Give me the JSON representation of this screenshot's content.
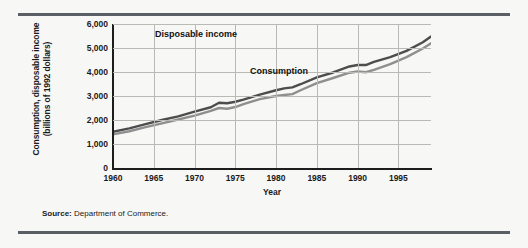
{
  "figure": {
    "source_prefix": "Source:",
    "source_text": " Department of Commerce."
  },
  "axes": {
    "ylabel_line1": "Consumption, disposable income",
    "ylabel_line2": "(billions of 1992 dollars)",
    "xlabel": "Year",
    "yticks": [
      "0",
      "1,000",
      "2,000",
      "3,000",
      "4,000",
      "5,000",
      "6,000"
    ],
    "xticks": [
      "1960",
      "1965",
      "1970",
      "1975",
      "1980",
      "1985",
      "1990",
      "1995"
    ]
  },
  "annotations": {
    "disposable_income": "Disposable income",
    "consumption": "Consumption"
  },
  "colors": {
    "disposable_income": "#4d4d4d",
    "consumption": "#8f8f8f",
    "grid": "#b9b9b5",
    "axis": "#1d1d1d",
    "rule": "#5a5f66"
  },
  "chart_data": {
    "type": "line",
    "title": "",
    "xlabel": "Year",
    "ylabel": "Consumption, disposable income (billions of 1992 dollars)",
    "xlim": [
      1960,
      1999
    ],
    "ylim": [
      0,
      6000
    ],
    "ytick_values": [
      0,
      1000,
      2000,
      3000,
      4000,
      5000,
      6000
    ],
    "xtick_values": [
      1960,
      1965,
      1970,
      1975,
      1980,
      1985,
      1990,
      1995
    ],
    "grid": true,
    "legend": "inline-annotations",
    "x": [
      1960,
      1962,
      1964,
      1966,
      1968,
      1970,
      1972,
      1973,
      1974,
      1975,
      1976,
      1978,
      1980,
      1981,
      1982,
      1983,
      1985,
      1987,
      1989,
      1990,
      1991,
      1992,
      1994,
      1996,
      1998,
      1999
    ],
    "series": [
      {
        "name": "Disposable income",
        "color": "#4d4d4d",
        "values": [
          1510,
          1650,
          1830,
          2000,
          2150,
          2350,
          2530,
          2720,
          2700,
          2760,
          2850,
          3060,
          3240,
          3320,
          3360,
          3490,
          3780,
          3980,
          4230,
          4290,
          4290,
          4420,
          4620,
          4880,
          5240,
          5480
        ]
      },
      {
        "name": "Consumption",
        "color": "#8f8f8f",
        "values": [
          1400,
          1530,
          1700,
          1860,
          2020,
          2180,
          2380,
          2500,
          2470,
          2540,
          2660,
          2870,
          3000,
          3040,
          3080,
          3240,
          3540,
          3750,
          3970,
          4020,
          3990,
          4090,
          4330,
          4620,
          4980,
          5200
        ]
      }
    ]
  }
}
